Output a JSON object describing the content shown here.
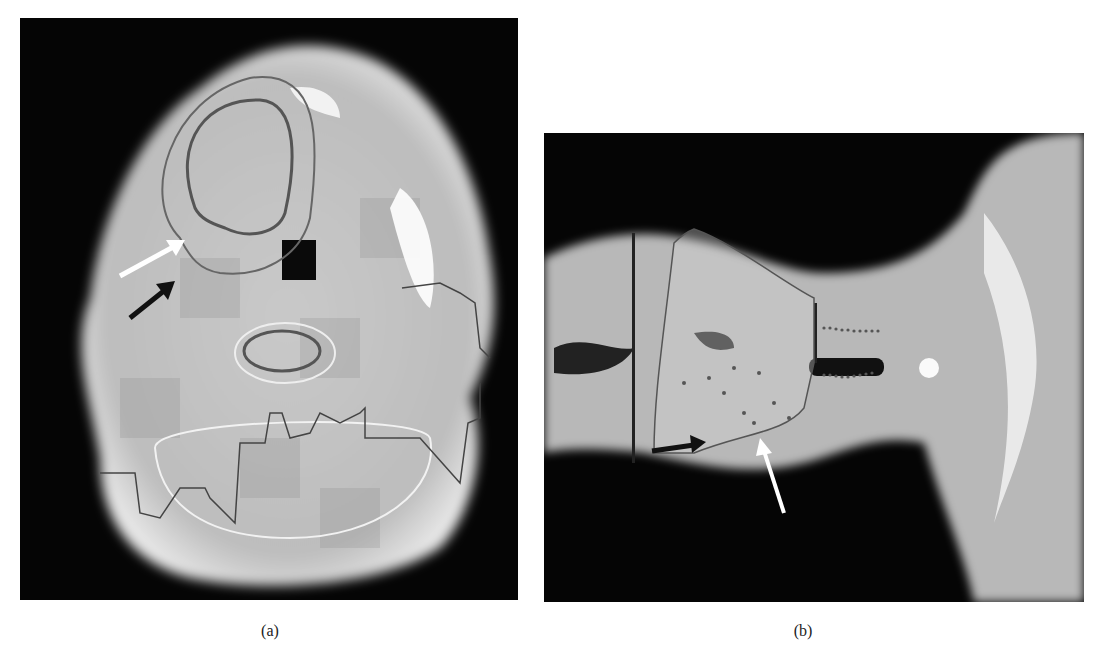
{
  "figure": {
    "panels": [
      {
        "id": "a",
        "label": "(a)",
        "view": "axial CT slice with dose overlay and contours",
        "annotations": [
          {
            "type": "arrow",
            "color": "#ffffff",
            "direction": "up-right"
          },
          {
            "type": "arrow",
            "color": "#111111",
            "direction": "up-right"
          }
        ]
      },
      {
        "id": "b",
        "label": "(b)",
        "view": "coronal/sagittal CT slice with dose overlay and contours",
        "annotations": [
          {
            "type": "arrow",
            "color": "#111111",
            "direction": "right"
          },
          {
            "type": "arrow",
            "color": "#ffffff",
            "direction": "up-left"
          }
        ]
      }
    ]
  },
  "colors": {
    "background": "#ffffff",
    "image_background": "#050505",
    "tissue_light": "#cfcfcf",
    "tissue_mid": "#a8a8a8",
    "contour_dark": "#555555",
    "contour_light": "#eeeeee"
  }
}
